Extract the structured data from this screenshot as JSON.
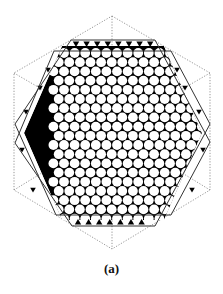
{
  "figure": {
    "caption": "(a)",
    "width": 223,
    "height": 294
  },
  "colors": {
    "ink": "#000000",
    "outline": "#333333",
    "dotted": "#8a8a8a",
    "background": "#ffffff"
  },
  "dotted_hexagon": {
    "points": [
      [
        112,
        16
      ],
      [
        210,
        73
      ],
      [
        210,
        190
      ],
      [
        112,
        249
      ],
      [
        14,
        190
      ],
      [
        14,
        73
      ]
    ],
    "inner_lines": [
      [
        [
          112,
          16
        ],
        [
          112,
          249
        ]
      ],
      [
        [
          14,
          73
        ],
        [
          112,
          130
        ]
      ],
      [
        [
          210,
          73
        ],
        [
          112,
          130
        ]
      ],
      [
        [
          14,
          190
        ],
        [
          112,
          130
        ]
      ],
      [
        [
          210,
          190
        ],
        [
          112,
          130
        ]
      ]
    ]
  },
  "solid_hexagons": [
    {
      "points": [
        [
          71,
          40
        ],
        [
          155,
          40
        ],
        [
          210,
          142
        ],
        [
          171,
          215
        ],
        [
          56,
          215
        ],
        [
          15,
          124
        ]
      ]
    },
    {
      "points": [
        [
          54,
          51
        ],
        [
          171,
          51
        ],
        [
          210,
          124
        ],
        [
          155,
          226
        ],
        [
          72,
          226
        ],
        [
          15,
          143
        ]
      ]
    }
  ],
  "tiling": {
    "region": [
      [
        62,
        46
      ],
      [
        164,
        46
      ],
      [
        202,
        133
      ],
      [
        164,
        220
      ],
      [
        62,
        220
      ],
      [
        24,
        133
      ]
    ],
    "lattice": {
      "origin_x": 64,
      "origin_y": 53,
      "dx": 10.6,
      "dy": 9.2,
      "rows": 19,
      "cols": 14,
      "radius": 4.9
    },
    "edge_triangles": {
      "top": {
        "y": 44,
        "x_start": 76,
        "x_end": 152,
        "step": 10.6,
        "dir": "down"
      },
      "bottom": {
        "y": 222,
        "x_start": 78,
        "x_end": 152,
        "step": 10.6,
        "dir": "up"
      },
      "left_side": [
        [
          26,
          112
        ],
        [
          22,
          150
        ],
        [
          33,
          190
        ],
        [
          40,
          88
        ],
        [
          48,
          70
        ]
      ],
      "right_side": [
        [
          199,
          112
        ],
        [
          203,
          150
        ],
        [
          192,
          190
        ],
        [
          185,
          88
        ],
        [
          177,
          70
        ]
      ]
    }
  }
}
